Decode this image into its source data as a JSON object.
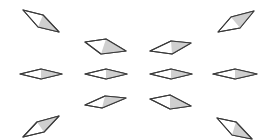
{
  "figure": {
    "background": "#ffffff",
    "stroke_color": "#3a3a3a",
    "shade_color": "#cfcfcf",
    "shapes": [
      {
        "id": "top-left",
        "points": [
          [
            23,
            10
          ],
          [
            43,
            15
          ],
          [
            59,
            32
          ],
          [
            38,
            27
          ]
        ],
        "shade": [
          [
            43,
            15
          ],
          [
            59,
            32
          ],
          [
            38,
            27
          ]
        ]
      },
      {
        "id": "top-right",
        "points": [
          [
            218,
            32
          ],
          [
            231,
            17
          ],
          [
            254,
            11
          ],
          [
            240,
            28
          ]
        ],
        "shade": [
          [
            231,
            17
          ],
          [
            254,
            11
          ],
          [
            240,
            28
          ]
        ]
      },
      {
        "id": "upper-left",
        "points": [
          [
            85,
            42
          ],
          [
            106,
            39
          ],
          [
            126,
            51
          ],
          [
            101,
            54
          ]
        ],
        "shade": [
          [
            106,
            39
          ],
          [
            126,
            51
          ],
          [
            101,
            54
          ]
        ]
      },
      {
        "id": "upper-right",
        "points": [
          [
            150,
            51
          ],
          [
            171,
            41
          ],
          [
            191,
            43
          ],
          [
            172,
            54
          ]
        ],
        "shade": [
          [
            171,
            41
          ],
          [
            191,
            43
          ],
          [
            172,
            54
          ]
        ]
      },
      {
        "id": "mid-far-left",
        "points": [
          [
            20,
            74
          ],
          [
            41,
            69
          ],
          [
            62,
            74
          ],
          [
            41,
            79
          ]
        ],
        "shade": [
          [
            41,
            69
          ],
          [
            62,
            74
          ],
          [
            41,
            79
          ]
        ]
      },
      {
        "id": "mid-left",
        "points": [
          [
            85,
            74
          ],
          [
            106,
            69
          ],
          [
            127,
            74
          ],
          [
            106,
            79
          ]
        ],
        "shade": [
          [
            106,
            69
          ],
          [
            127,
            74
          ],
          [
            106,
            79
          ]
        ]
      },
      {
        "id": "mid-right",
        "points": [
          [
            150,
            74
          ],
          [
            171,
            69
          ],
          [
            192,
            74
          ],
          [
            171,
            79
          ]
        ],
        "shade": [
          [
            171,
            69
          ],
          [
            192,
            74
          ],
          [
            171,
            79
          ]
        ]
      },
      {
        "id": "mid-far-right",
        "points": [
          [
            213,
            74
          ],
          [
            235,
            69
          ],
          [
            257,
            74
          ],
          [
            235,
            79
          ]
        ],
        "shade": [
          [
            235,
            69
          ],
          [
            257,
            74
          ],
          [
            235,
            79
          ]
        ]
      },
      {
        "id": "lower-left",
        "points": [
          [
            85,
            105
          ],
          [
            105,
            96
          ],
          [
            126,
            98
          ],
          [
            102,
            108
          ]
        ],
        "shade": [
          [
            105,
            96
          ],
          [
            126,
            98
          ],
          [
            102,
            108
          ]
        ]
      },
      {
        "id": "lower-right",
        "points": [
          [
            150,
            99
          ],
          [
            170,
            95
          ],
          [
            191,
            106
          ],
          [
            170,
            109
          ]
        ],
        "shade": [
          [
            170,
            95
          ],
          [
            191,
            106
          ],
          [
            170,
            109
          ]
        ]
      },
      {
        "id": "bottom-left",
        "points": [
          [
            23,
            137
          ],
          [
            37,
            122
          ],
          [
            59,
            116
          ],
          [
            44,
            132
          ]
        ],
        "shade": [
          [
            37,
            122
          ],
          [
            59,
            116
          ],
          [
            44,
            132
          ]
        ]
      },
      {
        "id": "bottom-right",
        "points": [
          [
            217,
            118
          ],
          [
            236,
            122
          ],
          [
            252,
            139
          ],
          [
            232,
            135
          ]
        ],
        "shade": [
          [
            236,
            122
          ],
          [
            252,
            139
          ],
          [
            232,
            135
          ]
        ]
      }
    ]
  }
}
